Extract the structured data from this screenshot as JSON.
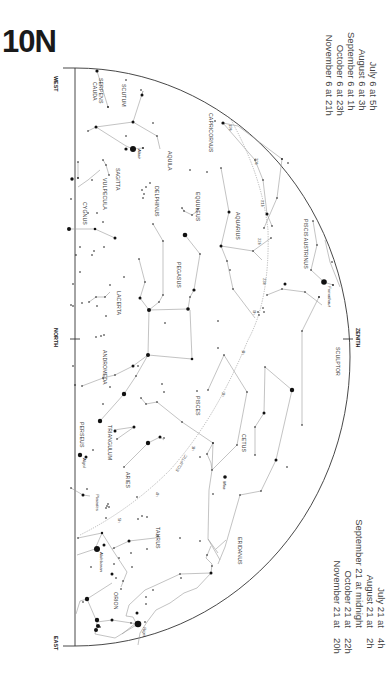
{
  "title": "10N",
  "directions": {
    "west": "WEST",
    "north": "NORTH",
    "east": "EAST",
    "zenith": "ZENITH"
  },
  "times_top": [
    {
      "date": "July 6 at",
      "hour": "5h"
    },
    {
      "date": "August 6 at",
      "hour": "3h"
    },
    {
      "date": "September 6 at",
      "hour": "1h"
    },
    {
      "date": "October 6 at",
      "hour": "23h"
    },
    {
      "date": "November 6 at",
      "hour": "21h"
    }
  ],
  "times_bottom": [
    {
      "date": "July 21 at",
      "hour": "4h"
    },
    {
      "date": "August 21 at",
      "hour": "2h"
    },
    {
      "date": "September 21 at midnight",
      "hour": ""
    },
    {
      "date": "October 21 at",
      "hour": "22h"
    },
    {
      "date": "November 21 at",
      "hour": "20h"
    }
  ],
  "constellations": [
    {
      "name": "SERPENS",
      "name2": "CAUDA"
    },
    {
      "name": "SCUTUM"
    },
    {
      "name": "AQUILA"
    },
    {
      "name": "SAGITTA"
    },
    {
      "name": "VULPECULA"
    },
    {
      "name": "DELPHINUS"
    },
    {
      "name": "CYGNUS"
    },
    {
      "name": "CAPRICORNUS"
    },
    {
      "name": "EQUULEUS"
    },
    {
      "name": "AQUARIUS"
    },
    {
      "name": "PEGASUS"
    },
    {
      "name": "PISCIS AUSTRINUS"
    },
    {
      "name": "LACERTA"
    },
    {
      "name": "ANDROMEDA"
    },
    {
      "name": "SCULPTOR"
    },
    {
      "name": "PISCES"
    },
    {
      "name": "CETUS"
    },
    {
      "name": "PERSEUS"
    },
    {
      "name": "TRIANGULUM"
    },
    {
      "name": "ARIES"
    },
    {
      "name": "TAURUS"
    },
    {
      "name": "ERIDANUS"
    },
    {
      "name": "ORION"
    }
  ],
  "stars": {
    "altair": "Altair",
    "fomalhaut": "Fomalhaut",
    "algol": "Algol",
    "mira": "Mira",
    "pleiades": "Pleiades",
    "aldebaran": "Aldebaran",
    "rigel": "Rigel"
  },
  "ecliptic": {
    "label": "ECLIPTIC",
    "ticks": [
      "19h",
      "20h",
      "21h",
      "22h",
      "23h",
      "0h",
      "1h",
      "2h",
      "3h",
      "4h",
      "5h"
    ]
  }
}
